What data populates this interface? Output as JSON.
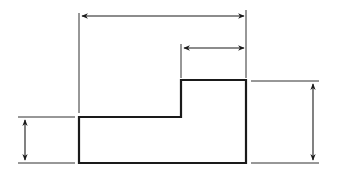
{
  "diagram": {
    "title": "",
    "colors": {
      "line": "#1a1a1a",
      "background": "#ffffff"
    },
    "shape": {
      "points": [
        [
          79,
          117
        ],
        [
          181,
          117
        ],
        [
          181,
          80
        ],
        [
          246,
          80
        ],
        [
          246,
          163
        ],
        [
          79,
          163
        ]
      ]
    },
    "dimensions": [
      {
        "id": "overall-width",
        "label": ""
      },
      {
        "id": "step-width",
        "label": ""
      },
      {
        "id": "left-height",
        "label": ""
      },
      {
        "id": "overall-height",
        "label": ""
      }
    ]
  }
}
